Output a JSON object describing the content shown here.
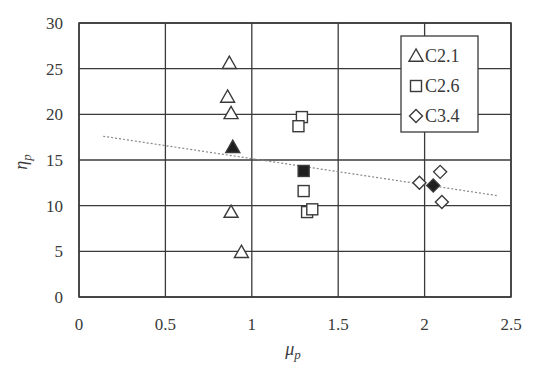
{
  "chart_data": {
    "type": "scatter",
    "title": "",
    "xlabel": "μ_p",
    "ylabel": "η_p",
    "xlim": [
      0,
      2.5
    ],
    "ylim": [
      0,
      30
    ],
    "xticks": [
      0,
      0.5,
      1,
      1.5,
      2,
      2.5
    ],
    "yticks": [
      0,
      5,
      10,
      15,
      20,
      25,
      30
    ],
    "xtick_labels": [
      "0",
      "0.5",
      "1",
      "1.5",
      "2",
      "2.5"
    ],
    "ytick_labels": [
      "0",
      "5",
      "10",
      "15",
      "20",
      "25",
      "30"
    ],
    "grid": true,
    "legend_position": "upper right",
    "series": [
      {
        "name": "C2.1",
        "marker": "triangle",
        "points": [
          {
            "x": 0.87,
            "y": 25.6
          },
          {
            "x": 0.86,
            "y": 21.9
          },
          {
            "x": 0.88,
            "y": 20.1
          },
          {
            "x": 0.88,
            "y": 9.3
          },
          {
            "x": 0.94,
            "y": 4.9
          }
        ],
        "mean": {
          "x": 0.89,
          "y": 16.4
        }
      },
      {
        "name": "C2.6",
        "marker": "square",
        "points": [
          {
            "x": 1.29,
            "y": 19.7
          },
          {
            "x": 1.27,
            "y": 18.7
          },
          {
            "x": 1.3,
            "y": 11.6
          },
          {
            "x": 1.32,
            "y": 9.3
          },
          {
            "x": 1.35,
            "y": 9.6
          }
        ],
        "mean": {
          "x": 1.3,
          "y": 13.8
        }
      },
      {
        "name": "C3.4",
        "marker": "diamond",
        "points": [
          {
            "x": 2.09,
            "y": 13.7
          },
          {
            "x": 1.97,
            "y": 12.5
          },
          {
            "x": 2.1,
            "y": 10.4
          }
        ],
        "mean": {
          "x": 2.05,
          "y": 12.2
        }
      }
    ],
    "trendline": {
      "style": "dotted",
      "x0": 0.14,
      "y0": 17.6,
      "x1": 2.42,
      "y1": 11.1
    }
  },
  "legend": {
    "items": [
      {
        "label": "C2.1",
        "marker": "triangle"
      },
      {
        "label": "C2.6",
        "marker": "square"
      },
      {
        "label": "C3.4",
        "marker": "diamond"
      }
    ]
  },
  "colors": {
    "axis": "#3a3a3a",
    "grid": "#3a3a3a",
    "marker_stroke": "#3a3a3a",
    "marker_fill_mean": "#1f1f1f",
    "trendline": "#888888"
  }
}
